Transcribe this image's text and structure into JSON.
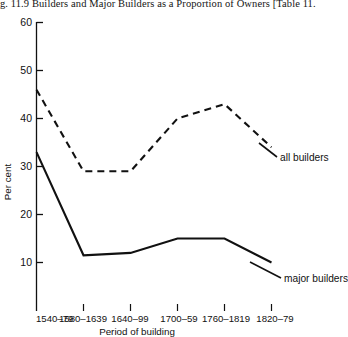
{
  "figure": {
    "title": "g. 11.9   Builders and Major Builders as a Proportion of Owners [Table 11."
  },
  "chart_data": {
    "type": "line",
    "title": "g. 11.9   Builders and Major Builders as a Proportion of Owners [Table 11.",
    "xlabel": "Period of building",
    "ylabel": "Per cent",
    "categories": [
      "1540–79",
      "1580–1639",
      "1640–99",
      "1700–59",
      "1760–1819",
      "1820–79"
    ],
    "ylim": [
      0,
      60
    ],
    "yticks": [
      10,
      20,
      30,
      40,
      50,
      60
    ],
    "grid": false,
    "legend_position": "inline-right",
    "series": [
      {
        "name": "all builders",
        "style": "dashed",
        "color": "#111111",
        "values": [
          46,
          29,
          29,
          40,
          43,
          34
        ]
      },
      {
        "name": "major builders",
        "style": "solid",
        "color": "#111111",
        "values": [
          33,
          11.5,
          12,
          15,
          15,
          10
        ]
      }
    ],
    "annotations": [
      {
        "text": "all builders",
        "series": "all builders"
      },
      {
        "text": "major builders",
        "series": "major builders"
      }
    ]
  },
  "axes": {
    "y_tick_labels": [
      "60",
      "50",
      "40",
      "30",
      "20",
      "10"
    ],
    "x_tick_labels": [
      "1540–79",
      "1580–1639",
      "1640–99",
      "1700–59",
      "1760–1819",
      "1820–79"
    ],
    "y_axis_title": "Per cent",
    "x_axis_title": "Period of building"
  },
  "labels": {
    "all_builders": "all builders",
    "major_builders": "major builders"
  }
}
